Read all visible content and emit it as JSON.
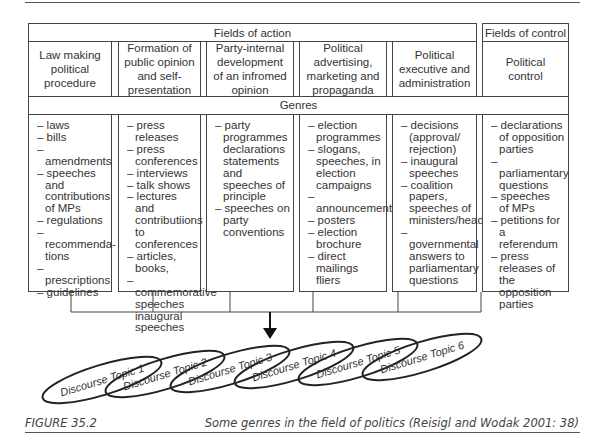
{
  "diagram": {
    "fields_of_action_label": "Fields of action",
    "fields_of_control_label": "Fields of control",
    "genres_label": "Genres",
    "columns": [
      {
        "header": "Law making political procedure",
        "header_lines": [
          "Law making",
          "political",
          "procedure"
        ],
        "genres": [
          [
            "– laws"
          ],
          [
            "– bills"
          ],
          [
            "– amendments"
          ],
          [
            "– speeches and",
            "contributions",
            "of MPs"
          ],
          [
            "– regulations"
          ],
          [
            "– recommenda-",
            "tions"
          ],
          [
            "– prescriptions"
          ],
          [
            "– guidelines"
          ]
        ]
      },
      {
        "header": "Formation of public opinion and self-presentation",
        "header_lines": [
          "Formation of",
          "public opinion",
          "and self-",
          "presentation"
        ],
        "genres": [
          [
            "– press releases"
          ],
          [
            "– press",
            "conferences"
          ],
          [
            "– interviews"
          ],
          [
            "– talk shows"
          ],
          [
            "– lectures and",
            "contributiions",
            "to conferences"
          ],
          [
            "– articles, books,"
          ],
          [
            "– commemorative",
            "speeches",
            "inaugural",
            "speeches"
          ]
        ]
      },
      {
        "header": "Party-internal development of an infromed opinion",
        "header_lines": [
          "Party-internal",
          "development",
          "of an infromed",
          "opinion"
        ],
        "genres": [
          [
            "– party",
            "programmes",
            "declarations",
            "statements",
            "and",
            "speeches of",
            "principle"
          ],
          [
            "– speeches on",
            "party",
            "conventions"
          ]
        ]
      },
      {
        "header": "Political advertising, marketing and propaganda",
        "header_lines": [
          "Political",
          "advertising,",
          "marketing and",
          "propaganda"
        ],
        "genres": [
          [
            "– election",
            "programmes"
          ],
          [
            "– slogans,",
            "speeches, in",
            "election",
            "campaigns"
          ],
          [
            "– announcements"
          ],
          [
            "– posters"
          ],
          [
            "– election",
            "brochure"
          ],
          [
            "– direct mailings",
            "fliers"
          ]
        ]
      },
      {
        "header": "Political executive and administration",
        "header_lines": [
          "Political",
          "executive and",
          "administration"
        ],
        "genres": [
          [
            "– decisions",
            "(approval/",
            "rejection)"
          ],
          [
            "– inaugural",
            "speeches"
          ],
          [
            "– coalition",
            "papers,",
            "speeches of",
            "ministers/heads"
          ],
          [
            "– governmental",
            "answers to",
            "parliamentary",
            "questions"
          ]
        ]
      },
      {
        "header": "Political control",
        "header_lines": [
          "Political",
          "control"
        ],
        "genres": [
          [
            "– declarations",
            "of opposition",
            "parties"
          ],
          [
            "– parliamentary",
            "questions"
          ],
          [
            "– speeches",
            "of MPs"
          ],
          [
            "– petitions for a",
            "referendum"
          ],
          [
            "– press",
            "releases of",
            "the opposition",
            "parties"
          ]
        ]
      }
    ],
    "discourse_topics": [
      "Discourse Topic 1",
      "Discourse Topic 2",
      "Discourse Topic 3",
      "Discourse Topic 4",
      "Discourse Topic 5",
      "Discourse Topic 6"
    ]
  },
  "caption": {
    "figure_label": "FIGURE 35.2",
    "text": "Some genres in the field of politics (Reisigl and Wodak 2001: 38)"
  }
}
